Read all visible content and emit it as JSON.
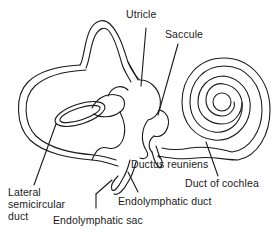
{
  "figure": {
    "line_color": "#1a1a1a",
    "background": "#ffffff"
  },
  "labels": {
    "utricle": "Utricle",
    "saccule": "Saccule",
    "lateral_semicircular_duct_line1": "Lateral",
    "lateral_semicircular_duct_line2": "semicircular",
    "lateral_semicircular_duct_line3": "duct",
    "ductus_reuniens": "Ductus reuniens",
    "duct_of_cochlea": "Duct of cochlea",
    "endolymphatic_duct": "Endolymphatic duct",
    "endolymphatic_sac": "Endolymphatic sac"
  }
}
